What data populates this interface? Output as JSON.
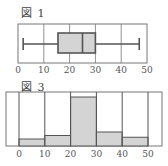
{
  "figures": {
    "fig1": {
      "label": "図 1"
    },
    "fig3": {
      "label": "図 3"
    }
  },
  "style": {
    "frame_color": "#777777",
    "fill_color": "#d4d4d4",
    "line_color": "#555555"
  },
  "chart_data": [
    {
      "type": "boxplot",
      "title": "図 1",
      "xlabel": "",
      "ylabel": "",
      "xlim": [
        0,
        50
      ],
      "x_ticks": [
        0,
        10,
        20,
        30,
        40,
        50
      ],
      "grid": "vertical",
      "min": 2,
      "q1": 15.5,
      "median": 25,
      "q3": 30,
      "max": 47
    },
    {
      "type": "bar",
      "title": "図 3",
      "subtype": "histogram",
      "xlabel": "",
      "ylabel": "",
      "xlim": [
        0,
        50
      ],
      "x_ticks": [
        0,
        10,
        20,
        30,
        40,
        50
      ],
      "categories": [
        "0-10",
        "10-20",
        "20-30",
        "30-40",
        "40-50"
      ],
      "bin_edges": [
        0,
        10,
        20,
        30,
        40,
        50
      ],
      "values": [
        2,
        3,
        14,
        4,
        2.5
      ],
      "note": "relative heights estimated; no y-axis scale shown"
    }
  ]
}
